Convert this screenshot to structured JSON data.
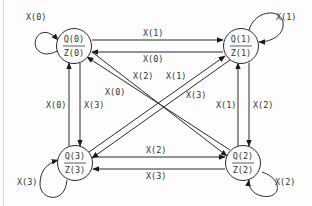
{
  "diagram": {
    "type": "state-transition",
    "nodes": [
      {
        "id": "q0",
        "state": "Q(0)",
        "output": "Z(0)",
        "cx": 74,
        "cy": 46
      },
      {
        "id": "q1",
        "state": "Q(1)",
        "output": "Z(1)",
        "cx": 241,
        "cy": 46
      },
      {
        "id": "q2",
        "state": "Q(2)",
        "output": "Z(2)",
        "cx": 243,
        "cy": 163
      },
      {
        "id": "q3",
        "state": "Q(3)",
        "output": "Z(3)",
        "cx": 75,
        "cy": 163
      }
    ],
    "edges": [
      {
        "from": "q0",
        "to": "q0",
        "label": "X(0)"
      },
      {
        "from": "q1",
        "to": "q1",
        "label": "X(1)"
      },
      {
        "from": "q2",
        "to": "q2",
        "label": "X(2)"
      },
      {
        "from": "q3",
        "to": "q3",
        "label": "X(3)"
      },
      {
        "from": "q0",
        "to": "q1",
        "label": "X(1)"
      },
      {
        "from": "q1",
        "to": "q0",
        "label": "X(0)"
      },
      {
        "from": "q3",
        "to": "q2",
        "label": "X(2)"
      },
      {
        "from": "q2",
        "to": "q3",
        "label": "X(3)"
      },
      {
        "from": "q3",
        "to": "q0",
        "label": "X(0)"
      },
      {
        "from": "q0",
        "to": "q3",
        "label": "X(3)"
      },
      {
        "from": "q2",
        "to": "q1",
        "label": "X(1)"
      },
      {
        "from": "q1",
        "to": "q2",
        "label": "X(2)"
      },
      {
        "from": "q2",
        "to": "q0",
        "label": "X(0)"
      },
      {
        "from": "q0",
        "to": "q2",
        "label": "X(2)"
      },
      {
        "from": "q3",
        "to": "q1",
        "label": "X(1)"
      },
      {
        "from": "q1",
        "to": "q3",
        "label": "X(3)"
      }
    ]
  },
  "labels": {
    "self_q0": "X(0)",
    "self_q1": "X(1)",
    "self_q2": "X(2)",
    "self_q3": "X(3)",
    "q0_to_q1": "X(1)",
    "q1_to_q0": "X(0)",
    "q3_to_q2": "X(2)",
    "q2_to_q3": "X(3)",
    "q3_to_q0": "X(0)",
    "q0_to_q3": "X(3)",
    "q2_to_q1": "X(1)",
    "q1_to_q2": "X(2)",
    "diag_q0q2_upper": "X(2)",
    "diag_q0q2_lower": "X(0)",
    "diag_q3q1_upper": "X(1)",
    "diag_q3q1_lower": "X(3)"
  },
  "nodes": {
    "q0": {
      "state": "Q(0)",
      "output": "Z(0)"
    },
    "q1": {
      "state": "Q(1)",
      "output": "Z(1)"
    },
    "q2": {
      "state": "Q(2)",
      "output": "Z(2)"
    },
    "q3": {
      "state": "Q(3)",
      "output": "Z(3)"
    }
  }
}
